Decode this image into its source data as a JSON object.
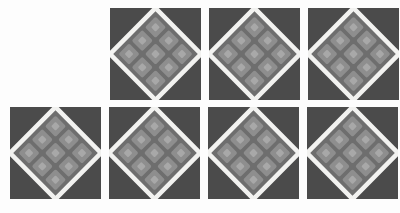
{
  "canvas": {
    "width": 400,
    "height": 213,
    "background_color": "#fdfdfd",
    "description": "Grid of seven repeated square tiles of a rotated-diamond lattice motif"
  },
  "palette": {
    "page_background": "#fdfdfd",
    "tile_background": "#4b4b4b",
    "diamond_border": "#f2f2f0",
    "diamond_fill": "#7d7d7d",
    "cell_fill": "#8e8e8e",
    "cell_core": "#a8a8a8",
    "cell_gap": "#6e6e6e"
  },
  "geometry": {
    "tile_width": 91,
    "tile_height": 92,
    "horizontal_gap": 8,
    "vertical_gap": 8,
    "row_top_y": 8,
    "row_bottom_y": 107,
    "inner_grid_rows": 3,
    "inner_grid_cols": 3,
    "diamond_rotation_deg": 45,
    "diamond_border_width": 5
  },
  "rows": [
    {
      "name": "top-row",
      "tile_count": 3,
      "y": 8,
      "tiles": [
        {
          "label": "tile-1",
          "x": 110,
          "y": 8
        },
        {
          "label": "tile-2",
          "x": 209,
          "y": 8
        },
        {
          "label": "tile-3",
          "x": 308,
          "y": 8
        }
      ]
    },
    {
      "name": "bottom-row",
      "tile_count": 4,
      "y": 107,
      "tiles": [
        {
          "label": "tile-4",
          "x": 10,
          "y": 107
        },
        {
          "label": "tile-5",
          "x": 109,
          "y": 107
        },
        {
          "label": "tile-6",
          "x": 208,
          "y": 107
        },
        {
          "label": "tile-7",
          "x": 307,
          "y": 107
        }
      ]
    }
  ]
}
